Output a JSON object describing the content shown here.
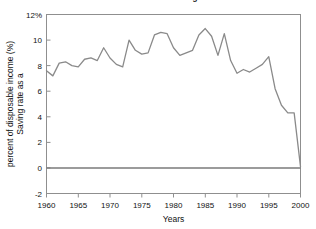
{
  "chart_data": {
    "type": "line",
    "title": "The U.S. Personal Saving Rate",
    "xlabel": "Years",
    "ylabel_line1": "Saving rate as a",
    "ylabel_line2": "percent of disposable income (%)",
    "ylabel": "Saving rate as a percent of disposable income (%)",
    "xlim": [
      1960,
      2000
    ],
    "ylim": [
      -2,
      12
    ],
    "grid": false,
    "legend": null,
    "line_color": "#8a8a8a",
    "zero_line_color": "#7a7a7a",
    "axis_color": "#8f8f8f",
    "xticks": [
      1960,
      1965,
      1970,
      1975,
      1980,
      1985,
      1990,
      1995,
      2000
    ],
    "xtick_labels": [
      "1960",
      "1965",
      "1970",
      "1975",
      "1980",
      "1985",
      "1990",
      "1995",
      "2000"
    ],
    "yticks": [
      -2,
      0,
      2,
      4,
      6,
      8,
      10,
      12
    ],
    "ytick_labels": [
      "-2",
      "0",
      "2",
      "4",
      "6",
      "8",
      "10",
      "12%"
    ],
    "x": [
      1960,
      1961,
      1962,
      1963,
      1964,
      1965,
      1966,
      1967,
      1968,
      1969,
      1970,
      1971,
      1972,
      1973,
      1974,
      1975,
      1976,
      1977,
      1978,
      1979,
      1980,
      1981,
      1982,
      1983,
      1984,
      1985,
      1986,
      1987,
      1988,
      1989,
      1990,
      1991,
      1992,
      1993,
      1994,
      1995,
      1996,
      1997,
      1998,
      1999,
      2000
    ],
    "values": [
      7.6,
      7.2,
      8.2,
      8.3,
      8.0,
      7.9,
      8.5,
      8.6,
      8.4,
      9.4,
      8.6,
      8.1,
      7.9,
      10.0,
      9.2,
      8.9,
      9.0,
      10.4,
      10.6,
      10.5,
      9.4,
      8.8,
      9.0,
      9.2,
      10.4,
      10.9,
      10.3,
      8.8,
      10.5,
      8.4,
      7.4,
      7.7,
      7.5,
      7.8,
      8.1,
      8.7,
      6.2,
      4.9,
      4.3,
      4.3,
      0.1
    ],
    "annotations": []
  }
}
